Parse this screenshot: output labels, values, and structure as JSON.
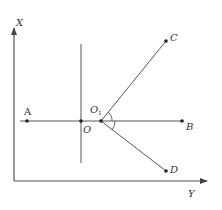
{
  "diagram": {
    "type": "geometry",
    "colors": {
      "line": "#555555",
      "point": "#222222",
      "text": "#333333"
    },
    "axes": {
      "x_axis": {
        "label": "X",
        "direction": "up"
      },
      "y_axis": {
        "label": "Y",
        "direction": "right"
      }
    },
    "points": [
      {
        "id": "A",
        "label": "A"
      },
      {
        "id": "O",
        "label": "O"
      },
      {
        "id": "O1",
        "label": "O",
        "subscript": "1"
      },
      {
        "id": "B",
        "label": "B"
      },
      {
        "id": "C",
        "label": "C"
      },
      {
        "id": "D",
        "label": "D"
      }
    ],
    "segments": [
      "AB",
      "O1C",
      "O1D",
      "vertical line through O"
    ],
    "angles": [
      "angle C-O1-B",
      "angle B-O1-D"
    ]
  }
}
